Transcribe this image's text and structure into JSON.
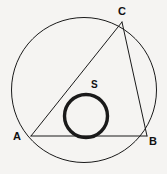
{
  "figure": {
    "background_color": "#f5f4f2",
    "stroke_color": "#1a1a1a",
    "width": 167,
    "height": 174
  },
  "labels": {
    "vertex_a": "A",
    "vertex_b": "B",
    "vertex_c": "C",
    "inner_circle": "S"
  },
  "geometry": {
    "outer_circle": {
      "cx": 84,
      "cy": 90,
      "r": 72.5,
      "stroke_width": 1
    },
    "inner_circle": {
      "cx": 86,
      "cy": 116,
      "r": 21.5,
      "stroke_width": 3.4
    },
    "vertex_a": {
      "x": 31,
      "y": 136
    },
    "vertex_b": {
      "x": 147,
      "y": 136
    },
    "vertex_c": {
      "x": 122,
      "y": 22
    },
    "side_ab": {
      "x1": 31,
      "y1": 136,
      "x2": 147,
      "y2": 136,
      "stroke_width": 1
    },
    "side_ac": {
      "x1": 31,
      "y1": 136,
      "x2": 122,
      "y2": 22,
      "stroke_width": 1
    },
    "side_cb": {
      "x1": 122,
      "y1": 22,
      "x2": 147,
      "y2": 136,
      "stroke_width": 1
    }
  }
}
